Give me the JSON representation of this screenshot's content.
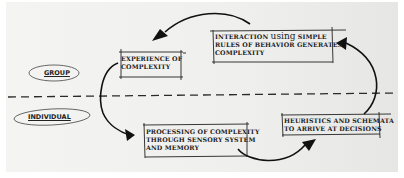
{
  "diagram": {
    "levels": {
      "group": "GROUP",
      "individual": "INDIVIDUAL"
    },
    "boxes": {
      "experience": {
        "line1": "EXPERIENCE OF",
        "line2": "COMPLEXITY"
      },
      "interaction": {
        "line1_a": "INTERACTION ",
        "line1_b": "using",
        "line1_c": " SIMPLE",
        "line2": "RULES OF BEHAVIOR GENERATES",
        "line3": "COMPLEXITY"
      },
      "processing": {
        "line1": "PROCESSING OF COMPLEXITY",
        "line2": "THROUGH SENSORY SYSTEM",
        "line3": "AND MEMORY"
      },
      "heuristics": {
        "line1": "HEURISTICS AND SCHEMATA",
        "line2": "TO ARRIVE AT DECISIONS"
      }
    },
    "flow": [
      "interaction -> experience",
      "experience -> processing",
      "processing -> heuristics",
      "heuristics -> interaction"
    ],
    "colors": {
      "ink": "#1d1d1d",
      "paper": "#f0f0ef"
    }
  }
}
